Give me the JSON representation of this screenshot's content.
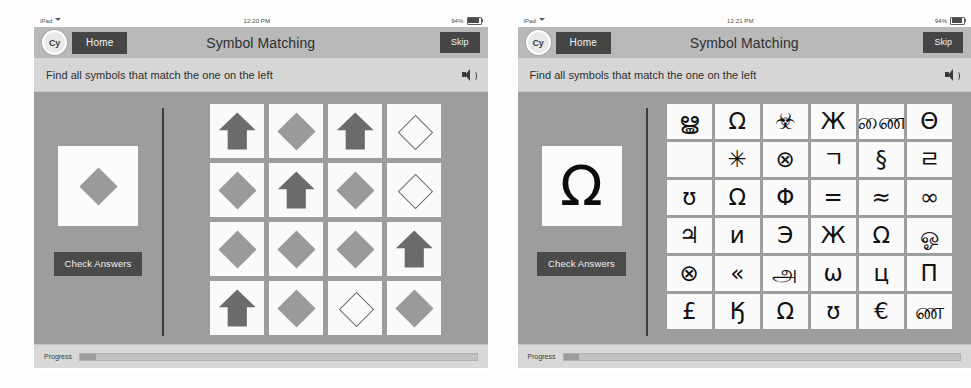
{
  "panels": [
    {
      "statusbar": {
        "device": "iPad",
        "wifi_icon": "wifi-icon",
        "time": "12:20 PM",
        "battery": "94%",
        "battery_icon": "battery-icon",
        "battery_level": 94
      },
      "navbar": {
        "logo": "Cy",
        "home_label": "Home",
        "title": "Symbol Matching",
        "skip_label": "Skip"
      },
      "instruction": {
        "text": "Find all symbols that match the one on the left",
        "speaker_icon": "speaker-icon"
      },
      "target": {
        "symbol": "diamond-filled",
        "glyph": ""
      },
      "check_label": "Check Answers",
      "grid": {
        "type": "shapes",
        "columns": 4,
        "cells": [
          "arrow-filled",
          "diamond-filled",
          "arrow-filled",
          "diamond-outline",
          "diamond-filled",
          "arrow-filled",
          "diamond-filled",
          "diamond-outline",
          "diamond-filled",
          "diamond-filled",
          "diamond-filled",
          "arrow-filled",
          "arrow-filled",
          "diamond-filled",
          "diamond-outline",
          "diamond-filled"
        ]
      },
      "progress": {
        "label": "Progress",
        "percent": 4
      }
    },
    {
      "statusbar": {
        "device": "iPad",
        "wifi_icon": "wifi-icon",
        "time": "12:21 PM",
        "battery": "94%",
        "battery_icon": "battery-icon",
        "battery_level": 94
      },
      "navbar": {
        "logo": "Cy",
        "home_label": "Home",
        "title": "Symbol Matching",
        "skip_label": "Skip"
      },
      "instruction": {
        "text": "Find all symbols that match the one on the left",
        "speaker_icon": "speaker-icon"
      },
      "target": {
        "symbol": "glyph",
        "glyph": "Ω"
      },
      "check_label": "Check Answers",
      "grid": {
        "type": "glyphs",
        "columns": 6,
        "cells": [
          "ൠ",
          "Ω",
          "☣",
          "Ж",
          "ணை",
          "Θ",
          "৞",
          "✳",
          "⊗",
          "ㄱ",
          "§",
          "ㄹ",
          "ʊ",
          "Ω",
          "Φ",
          "=",
          "≈",
          "∞",
          "♃",
          "и",
          "Э",
          "Ж",
          "Ω",
          "ஓ",
          "⊗",
          "«",
          "அ",
          "ѡ",
          "ц",
          "П",
          "£",
          "Ӄ",
          "Ω",
          "ʊ",
          "€",
          "ண"
        ]
      },
      "progress": {
        "label": "Progress",
        "percent": 4
      }
    }
  ],
  "colors": {
    "nav_bg": "#b9b9b9",
    "instruct_bg": "#d6d6d6",
    "body_bg": "#9d9d9d",
    "button_bg": "#454545",
    "tile_bg": "#fafafa",
    "shape_fill": "#9a9a9a",
    "arrow_fill": "#6b6b6b"
  }
}
